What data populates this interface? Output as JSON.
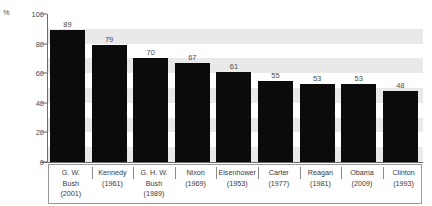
{
  "chart_data": {
    "type": "bar",
    "title": "",
    "xlabel": "",
    "ylabel": "%",
    "ylim": [
      0,
      100
    ],
    "yticks": [
      0,
      20,
      40,
      60,
      80,
      100
    ],
    "grid": "horizontal-bands",
    "legend": "none",
    "bar_color": "#0b0b0b",
    "band_color": "#e9e9e9",
    "categories": [
      "G. W. Bush (2001)",
      "Kennedy (1961)",
      "G. H. W. Bush (1989)",
      "Nixon (1969)",
      "Eisenhower (1953)",
      "Carter (1977)",
      "Reagan (1981)",
      "Obama (2009)",
      "Clinton (1993)"
    ],
    "values": [
      89,
      79,
      70,
      67,
      61,
      55,
      53,
      53,
      48
    ],
    "labels": [
      {
        "name_lines": [
          "G. W.",
          "Bush"
        ],
        "year": "(2001)",
        "value": 89
      },
      {
        "name_lines": [
          "Kennedy"
        ],
        "year": "(1961)",
        "value": 79
      },
      {
        "name_lines": [
          "G. H. W.",
          "Bush"
        ],
        "year": "(1989)",
        "value": 70
      },
      {
        "name_lines": [
          "Nixon"
        ],
        "year": "(1969)",
        "value": 67
      },
      {
        "name_lines": [
          "Eisenhower"
        ],
        "year": "(1953)",
        "value": 61
      },
      {
        "name_lines": [
          "Carter"
        ],
        "year": "(1977)",
        "value": 55
      },
      {
        "name_lines": [
          "Reagan"
        ],
        "year": "(1981)",
        "value": 53
      },
      {
        "name_lines": [
          "Obama"
        ],
        "year": "(2009)",
        "value": 53
      },
      {
        "name_lines": [
          "Clinton"
        ],
        "year": "(1993)",
        "value": 48
      }
    ]
  },
  "axis": {
    "unit": "%",
    "tick_100": "100",
    "tick_80": "80",
    "tick_60": "60",
    "tick_40": "40",
    "tick_20": "20",
    "tick_0": "0"
  }
}
